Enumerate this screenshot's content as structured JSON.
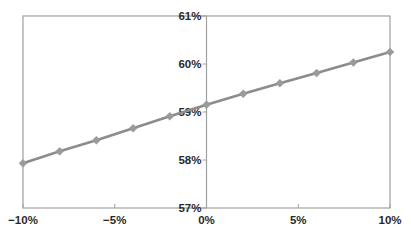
{
  "chart_data": {
    "type": "line",
    "title": "",
    "xlabel": "",
    "ylabel": "",
    "x": [
      -10,
      -8,
      -6,
      -4,
      -2,
      0,
      2,
      4,
      6,
      8,
      10
    ],
    "series": [
      {
        "name": "",
        "values": [
          57.93,
          58.18,
          58.41,
          58.66,
          58.91,
          59.15,
          59.38,
          59.6,
          59.81,
          60.03,
          60.25
        ],
        "color": "#8c8c8c",
        "marker": "diamond",
        "marker_color": "#9a9a9a"
      }
    ],
    "xlim": [
      -10,
      10
    ],
    "ylim": [
      57,
      61
    ],
    "x_ticks": [
      -10,
      -5,
      0,
      5,
      10
    ],
    "x_tick_labels": [
      "−10%",
      "−5%",
      "0%",
      "5%",
      "10%"
    ],
    "y_ticks": [
      57,
      58,
      59,
      60,
      61
    ],
    "y_tick_labels": [
      "57%",
      "58%",
      "59%",
      "60%",
      "61%"
    ],
    "grid": false,
    "legend": null,
    "axis_crossing": "y-axis at x=0, x-axis at y=57%",
    "frame": true,
    "colors": {
      "frame": "#a0a0a0",
      "axis": "#a0a0a0",
      "line": "#8c8c8c",
      "text": "#2a2a2a"
    }
  }
}
